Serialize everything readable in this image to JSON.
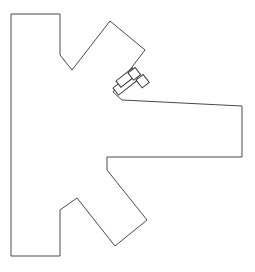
{
  "canvas": {
    "width": 255,
    "height": 272,
    "background_color": "#ffffff"
  },
  "drawing": {
    "title": "Branching cross-section line drawing",
    "stroke_color": "#4a4a4a",
    "detail_stroke_color": "#3b3b3b",
    "fill_color": "#ffffff",
    "stroke_width": 1,
    "outline": {
      "name": "main-outline",
      "closed": true,
      "points": "11,14 60,14 60,55 72,70 110,21 145,50 113,92 122,100 242,106 242,157 107,157 107,170 147,220 115,246 77,198 60,210 60,256 11,256"
    },
    "details": [
      {
        "name": "detail-bar-lower",
        "type": "rect",
        "x": 113,
        "y": 88,
        "width": 25,
        "height": 9,
        "rotation": -38,
        "origin": "113 88"
      },
      {
        "name": "detail-bar-upper",
        "type": "rect",
        "x": 116,
        "y": 81,
        "width": 21,
        "height": 8,
        "rotation": -38,
        "origin": "116 81"
      },
      {
        "name": "detail-square-top",
        "type": "rect",
        "x": 128,
        "y": 73,
        "width": 9,
        "height": 9,
        "rotation": -38,
        "origin": "128 73"
      },
      {
        "name": "detail-square-right",
        "type": "rect",
        "x": 136,
        "y": 80,
        "width": 9,
        "height": 10,
        "rotation": -38,
        "origin": "136 80"
      }
    ]
  }
}
